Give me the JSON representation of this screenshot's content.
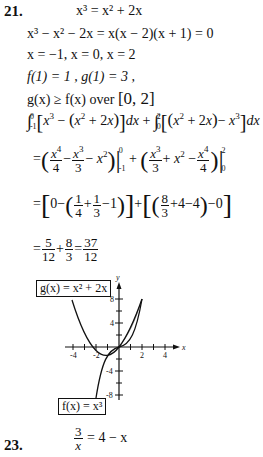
{
  "problem21": {
    "number": "21.",
    "lines": [
      "x³ = x² + 2x",
      "x³ − x² − 2x = x(x − 2)(x + 1) = 0",
      "x = −1, x = 0, x = 2",
      "f(1) = 1 ,  g(1) = 3 ,",
      "g(x) ≥ f(x)  over [0,2]",
      "∫₋₁⁰ [x³ − (x² + 2x)] dx + ∫₀² [(x² + 2x) − x³] dx",
      "= (x⁴/4 − x³/3 − x²)|₋₁⁰ + (x³/3 + x² − x⁴/4)|₀²",
      "= [0 − (1/4 + 1/3 − 1)] + [(8/3 + 4 − 4) − 0]",
      "= 5/12 + 8/3 = 37/12"
    ],
    "line_texts": {
      "l1": "x³ = x² + 2x",
      "l2": "x³ − x² − 2x = x(x − 2)(x + 1) = 0",
      "l3": "x = −1, x = 0, x = 2",
      "l4": "f(1) = 1 ,   g(1) = 3 ,",
      "l5a": "g(x) ≥ f(x)  over ",
      "l5b": "[0, 2]"
    },
    "result": "37/12"
  },
  "graph": {
    "g_label": "g(x) = x² + 2x",
    "f_label": "f(x) = x³",
    "x_axis_label": "x",
    "y_axis_label": "y",
    "x_ticks": [
      "-4",
      "-2",
      "2",
      "4"
    ],
    "y_ticks": [
      "8",
      "4",
      "-4",
      "-8"
    ],
    "shade_color": "#a9a9a9"
  },
  "problem23": {
    "number": "23.",
    "lhs_num": "3",
    "lhs_den": "x",
    "rhs": "= 4 − x"
  }
}
